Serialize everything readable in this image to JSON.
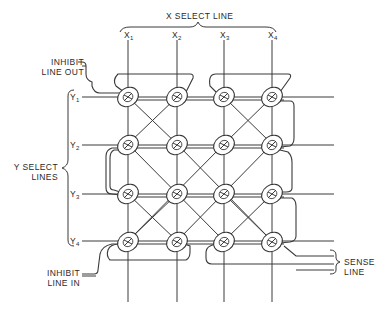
{
  "diagram": {
    "title": "X SELECT LINE",
    "x_lines": [
      {
        "name": "X",
        "sub": "1"
      },
      {
        "name": "X",
        "sub": "2"
      },
      {
        "name": "X",
        "sub": "3"
      },
      {
        "name": "X",
        "sub": "4"
      }
    ],
    "y_group_label": [
      "Y SELECT",
      "LINES"
    ],
    "y_lines": [
      {
        "name": "Y",
        "sub": "1"
      },
      {
        "name": "Y",
        "sub": "2"
      },
      {
        "name": "Y",
        "sub": "3"
      },
      {
        "name": "Y",
        "sub": "4"
      }
    ],
    "inhibit_out": [
      "INHIBIT",
      "LINE OUT"
    ],
    "inhibit_in": [
      "INHIBIT",
      "LINE IN"
    ],
    "sense_line": [
      "SENSE",
      "LINE"
    ],
    "grid": {
      "columns_x": [
        128,
        177,
        224,
        272
      ],
      "rows_y": [
        97,
        144,
        194,
        241
      ],
      "core_count": 16
    },
    "colors": {
      "line": "#3a3a3a",
      "background": "#ffffff",
      "text": "#2a2a2a"
    }
  }
}
